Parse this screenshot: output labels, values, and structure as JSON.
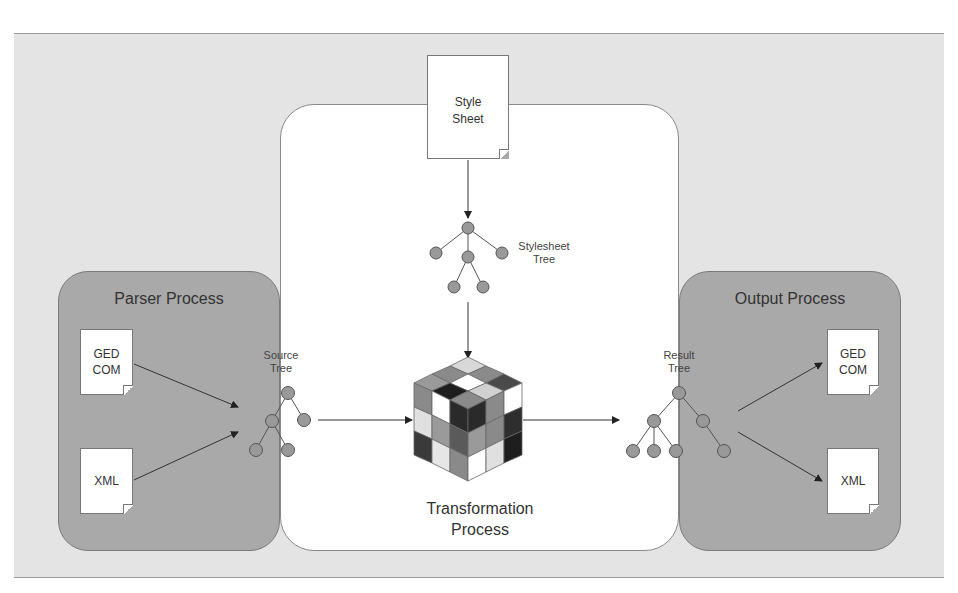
{
  "diagram": {
    "colors": {
      "outer_background": "#e4e4e4",
      "process_box": "#a9a9a9",
      "transformation_box": "#ffffff",
      "tree_node": "#999999"
    },
    "parser_process": {
      "title": "Parser Process",
      "documents": [
        {
          "line1": "GED",
          "line2": "COM"
        },
        {
          "line1": "XML",
          "line2": ""
        }
      ]
    },
    "source_tree": {
      "line1": "Source",
      "line2": "Tree"
    },
    "style_sheet": {
      "line1": "Style",
      "line2": "Sheet"
    },
    "stylesheet_tree": {
      "line1": "Stylesheet",
      "line2": "Tree"
    },
    "transformation": {
      "line1": "Transformation",
      "line2": "Process",
      "icon": "rubiks-cube-icon"
    },
    "result_tree": {
      "line1": "Result",
      "line2": "Tree"
    },
    "output_process": {
      "title": "Output Process",
      "documents": [
        {
          "line1": "GED",
          "line2": "COM"
        },
        {
          "line1": "XML",
          "line2": ""
        }
      ]
    },
    "flows": [
      "GEDCOM -> Source Tree",
      "XML -> Source Tree",
      "Style Sheet -> Stylesheet Tree",
      "Stylesheet Tree -> Transformation Process",
      "Source Tree -> Transformation Process",
      "Transformation Process -> Result Tree",
      "Result Tree -> GEDCOM",
      "Result Tree -> XML"
    ]
  }
}
